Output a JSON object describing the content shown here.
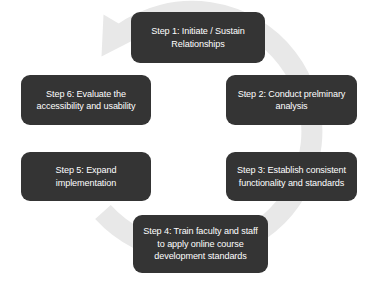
{
  "diagram": {
    "type": "cycle",
    "title": "",
    "direction": "clockwise",
    "background_color": "#ffffff",
    "box_color": "#343434",
    "box_text_color": "#ffffff",
    "arrow_color": "#e8e8e8",
    "steps": [
      {
        "id": "step-1",
        "number": 1,
        "label": "Step 1: Initiate / Sustain\nRelationships"
      },
      {
        "id": "step-2",
        "number": 2,
        "label": "Step 2: Conduct prelminary\nanalysis"
      },
      {
        "id": "step-3",
        "number": 3,
        "label": "Step 3: Establish consistent\nfunctionality and standards"
      },
      {
        "id": "step-4",
        "number": 4,
        "label": "Step 4: Train faculty and staff\nto apply online course\ndevelopment standards"
      },
      {
        "id": "step-5",
        "number": 5,
        "label": "Step 5: Expand\nimplementation"
      },
      {
        "id": "step-6",
        "number": 6,
        "label": "Step 6: Evaluate the\naccessibility and usability"
      }
    ]
  }
}
